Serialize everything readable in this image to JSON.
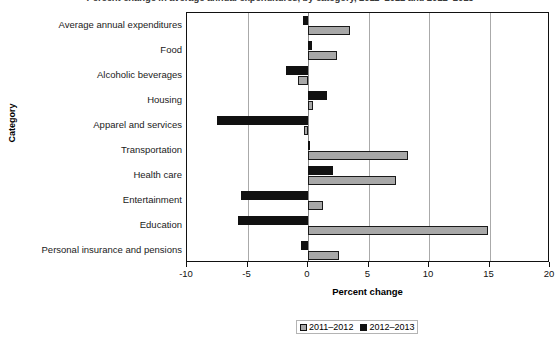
{
  "chart_data": {
    "type": "bar",
    "orientation": "horizontal",
    "title": "Percent change in average annual expenditures, by category, 2011–2012 and 2012–2013",
    "xlabel": "Percent change",
    "ylabel": "Category",
    "xlim": [
      -10,
      20
    ],
    "xticks": [
      -10,
      -5,
      0,
      5,
      10,
      15,
      20
    ],
    "xtick_labels": [
      "-10",
      "-5",
      "0",
      "5",
      "10",
      "15",
      "20"
    ],
    "grid": true,
    "legend_position": "bottom",
    "categories": [
      "Average annual expenditures",
      "Food",
      "Alcoholic beverages",
      "Housing",
      "Apparel and services",
      "Transportation",
      "Health care",
      "Entertainment",
      "Education",
      "Personal insurance and pensions"
    ],
    "series": [
      {
        "name": "2011–2012",
        "color": "#a8a8a8",
        "values": [
          3.5,
          2.4,
          -0.8,
          0.4,
          -0.3,
          8.3,
          7.3,
          1.2,
          14.9,
          2.6
        ]
      },
      {
        "name": "2012–2013",
        "color": "#111111",
        "values": [
          -0.4,
          0.3,
          -1.8,
          1.6,
          -7.5,
          0.1,
          2.1,
          -5.5,
          -5.8,
          -0.6
        ]
      }
    ]
  },
  "legend": {
    "entries": [
      {
        "label": "2011–2012",
        "swatch": "gray"
      },
      {
        "label": "2012–2013",
        "swatch": "black"
      }
    ]
  }
}
